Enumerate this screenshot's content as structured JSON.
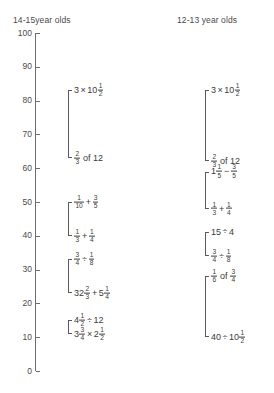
{
  "chart_data": {
    "type": "range-bracket",
    "title": "",
    "xlabel": "",
    "ylabel": "",
    "ylim": [
      0,
      100
    ],
    "y_ticks": [
      100,
      90,
      80,
      70,
      60,
      50,
      40,
      30,
      20,
      10,
      0
    ],
    "grid": false,
    "legend": "none",
    "groups": [
      {
        "name": "14-15year olds",
        "header": "14-15year olds",
        "items": [
          {
            "top_label": "3 × 10½",
            "top_value": 83,
            "bottom_label": "⅔ of 12",
            "bottom_value": 63
          },
          {
            "top_label": "1/10 + 3/5",
            "top_value": 50,
            "bottom_label": "1/3 + 1/4",
            "bottom_value": 40
          },
          {
            "top_label": "3/4 ÷ 1/8",
            "top_value": 33,
            "bottom_label": "32⅔ + 5¼",
            "bottom_value": 23
          },
          {
            "top_label": "4½ ÷ 12",
            "top_value": 15,
            "bottom_label": "3¾ × 2½",
            "bottom_value": 11
          }
        ]
      },
      {
        "name": "12-13 year olds",
        "header": "12-13 year olds",
        "items": [
          {
            "top_label": "3 × 10½",
            "top_value": 83,
            "bottom_label": "⅔ of 12",
            "bottom_value": 62
          },
          {
            "top_label": "1 1/5 − 3/5",
            "top_value": 59,
            "bottom_label": "1/3 + 1/4",
            "bottom_value": 48
          },
          {
            "top_label": "15 ÷ 4",
            "top_value": 41,
            "bottom_label": "3/4 ÷ 1/8",
            "bottom_value": 34
          },
          {
            "top_label": "1/6 of 3/4",
            "top_value": 28,
            "bottom_label": "40 ÷ 10½",
            "bottom_value": 10
          }
        ]
      }
    ]
  },
  "headers": {
    "left": "14-15year olds",
    "right": "12-13 year olds"
  },
  "axis": {
    "labels": [
      "100",
      "90",
      "80",
      "70",
      "60",
      "50",
      "40",
      "30",
      "20",
      "10",
      "0"
    ]
  },
  "expressions": {
    "left": {
      "g1_top": {
        "lead": "3",
        "op": "×",
        "tail": "10",
        "frac": {
          "n": "1",
          "d": "2"
        }
      },
      "g1_bottom": {
        "frac": {
          "n": "2",
          "d": "3"
        },
        "tail": "of 12"
      },
      "g2_top": {
        "f1": {
          "n": "1",
          "d": "10"
        },
        "op": "+",
        "f2": {
          "n": "3",
          "d": "5"
        }
      },
      "g2_bottom": {
        "f1": {
          "n": "1",
          "d": "3"
        },
        "op": "+",
        "f2": {
          "n": "1",
          "d": "4"
        }
      },
      "g3_top": {
        "f1": {
          "n": "3",
          "d": "4"
        },
        "op": "÷",
        "f2": {
          "n": "1",
          "d": "8"
        }
      },
      "g3_bottom": {
        "w1": "32",
        "f1": {
          "n": "2",
          "d": "3"
        },
        "op": "+",
        "w2": "5",
        "f2": {
          "n": "1",
          "d": "4"
        }
      },
      "g4_top": {
        "w1": "4",
        "f1": {
          "n": "1",
          "d": "2"
        },
        "op": "÷",
        "tail": "12"
      },
      "g4_bottom": {
        "w1": "3",
        "f1": {
          "n": "3",
          "d": "4"
        },
        "op": "×",
        "w2": "2",
        "f2": {
          "n": "1",
          "d": "2"
        }
      }
    },
    "right": {
      "g1_top": {
        "lead": "3",
        "op": "×",
        "tail": "10",
        "frac": {
          "n": "1",
          "d": "2"
        }
      },
      "g1_bottom": {
        "frac": {
          "n": "2",
          "d": "3"
        },
        "tail": "of 12"
      },
      "g2_top": {
        "w1": "1",
        "f1": {
          "n": "1",
          "d": "5"
        },
        "op": "−",
        "f2": {
          "n": "3",
          "d": "5"
        }
      },
      "g2_bottom": {
        "f1": {
          "n": "1",
          "d": "3"
        },
        "op": "+",
        "f2": {
          "n": "1",
          "d": "4"
        }
      },
      "g3_top": {
        "lead": "15",
        "op": "÷",
        "tail": "4"
      },
      "g3_bottom": {
        "f1": {
          "n": "3",
          "d": "4"
        },
        "op": "÷",
        "f2": {
          "n": "1",
          "d": "8"
        }
      },
      "g4_top": {
        "f1": {
          "n": "1",
          "d": "6"
        },
        "mid": "of",
        "f2": {
          "n": "3",
          "d": "4"
        }
      },
      "g4_bottom": {
        "lead": "40",
        "op": "÷",
        "tail": "10",
        "frac": {
          "n": "1",
          "d": "2"
        }
      }
    }
  }
}
